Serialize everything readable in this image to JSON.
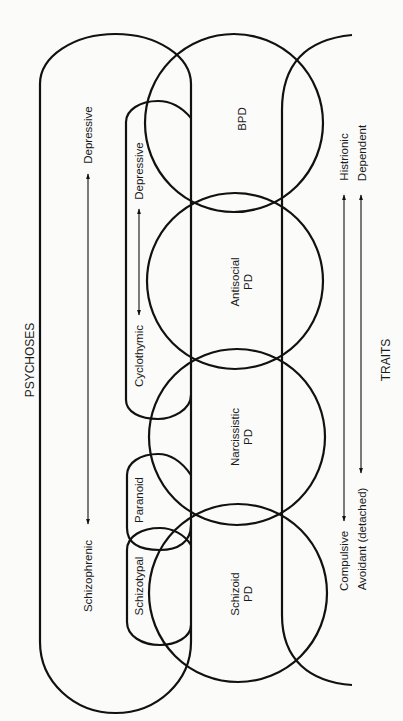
{
  "diagram": {
    "orientation": "rotated-90-ccw",
    "colors": {
      "line": "#111111",
      "background": "#fbfbfa"
    },
    "groups": {
      "psychoses": "PSYCHOSES",
      "traits": "TRAITS"
    },
    "psychosis_spectrum": {
      "top": "Depressive",
      "bottom": "Schizophrenic"
    },
    "cyclothymic_spectrum": {
      "top": "Depressive",
      "bottom": "Cyclothymic"
    },
    "small_shapes": {
      "paranoid": "Paranoid",
      "schizotypal": "Schizotypal"
    },
    "circles": [
      {
        "id": "bpd",
        "label": "BPD",
        "line2": ""
      },
      {
        "id": "antisocial",
        "label": "Antisocial",
        "line2": "PD"
      },
      {
        "id": "narcissistic",
        "label": "Narcissistic",
        "line2": "PD"
      },
      {
        "id": "schizoid",
        "label": "Schizoid",
        "line2": "PD"
      }
    ],
    "trait_spectra": [
      {
        "top": "Histrionic",
        "bottom": "Compulsive"
      },
      {
        "top": "Dependent",
        "bottom": "Avoidant (detached)"
      }
    ]
  }
}
